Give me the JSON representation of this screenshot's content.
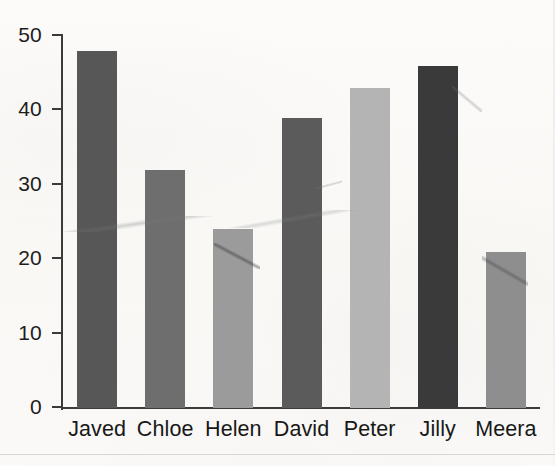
{
  "chart_data": {
    "type": "bar",
    "title": "",
    "subtitle": "",
    "xlabel": "",
    "ylabel": "",
    "categories": [
      "Javed",
      "Chloe",
      "Helen",
      "David",
      "Peter",
      "Jilly",
      "Meera"
    ],
    "values": [
      48,
      32,
      24,
      39,
      43,
      46,
      21
    ],
    "series": [
      {
        "name": "",
        "values": [
          48,
          32,
          24,
          39,
          43,
          46,
          21
        ]
      }
    ],
    "bar_colors": [
      "#575757",
      "#6e6e6e",
      "#9b9b9b",
      "#5b5b5b",
      "#b4b4b4",
      "#3a3a3a",
      "#8e8e8e"
    ],
    "ylim": [
      0,
      50
    ],
    "yticks": [
      0,
      10,
      20,
      30,
      40,
      50
    ],
    "ytick_labels": [
      "0",
      "10",
      "20",
      "30",
      "40",
      "50"
    ],
    "xtick_labels": [
      "Javed",
      "Chloe",
      "Helen",
      "David",
      "Peter",
      "Jilly",
      "Meera"
    ],
    "grid": false,
    "legend": false,
    "legend_position": "none",
    "annotations": []
  },
  "axis": {
    "color": "#3b3b3b",
    "y_min": 0,
    "y_max": 50,
    "tick_step": 10
  },
  "page": {
    "background": "#fbfaf8",
    "text_color": "#1d1d1d"
  }
}
